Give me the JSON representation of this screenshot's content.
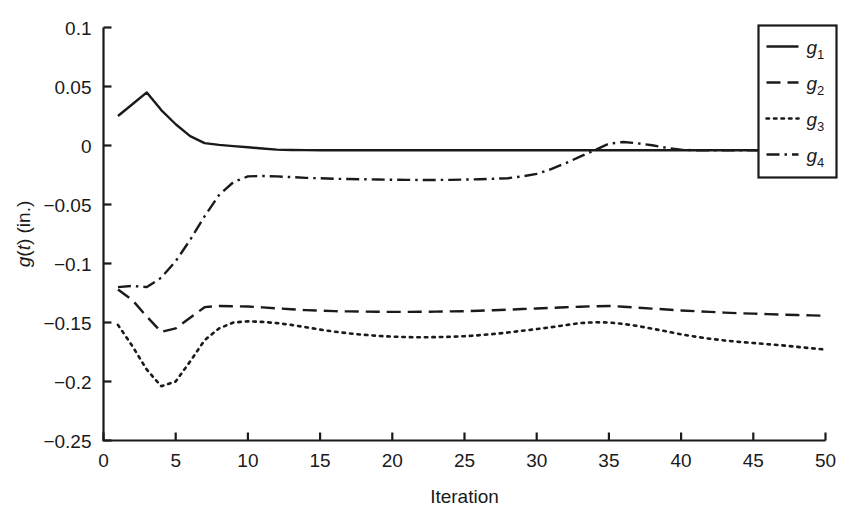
{
  "chart_data": {
    "type": "line",
    "title": "",
    "xlabel": "Iteration",
    "ylabel": "g(t) (in.)",
    "ylabel_parts": {
      "g": "g",
      "open": "(",
      "t": "t",
      "close": ")",
      "unit": " (in.)"
    },
    "xlim": [
      0,
      50
    ],
    "ylim": [
      -0.25,
      0.1
    ],
    "xticks": [
      0,
      5,
      10,
      15,
      20,
      25,
      30,
      35,
      40,
      45,
      50
    ],
    "xticklabels": [
      "0",
      "5",
      "10",
      "15",
      "20",
      "25",
      "30",
      "35",
      "40",
      "45",
      "50"
    ],
    "yticks": [
      0.1,
      0.05,
      0,
      -0.05,
      -0.1,
      -0.15,
      -0.2,
      -0.25
    ],
    "yticklabels": [
      "0.1",
      "0.05",
      "0",
      "−0.05",
      "−0.1",
      "−0.15",
      "−0.2",
      "−0.25"
    ],
    "grid": false,
    "legend_position": "top-right",
    "line_color": "#1a1a1a",
    "x": [
      1,
      2,
      3,
      4,
      5,
      6,
      7,
      8,
      9,
      10,
      11,
      12,
      13,
      14,
      15,
      16,
      17,
      18,
      19,
      20,
      21,
      22,
      23,
      24,
      25,
      26,
      27,
      28,
      29,
      30,
      31,
      32,
      33,
      34,
      35,
      36,
      37,
      38,
      39,
      40,
      41,
      42,
      43,
      44,
      45,
      46,
      47,
      48,
      49,
      50
    ],
    "series": [
      {
        "name": "g1",
        "label": "g",
        "sublabel": "1",
        "dash": "solid",
        "values": [
          0.025,
          0.035,
          0.045,
          0.03,
          0.018,
          0.008,
          0.002,
          0.0005,
          -0.0005,
          -0.0015,
          -0.0025,
          -0.0035,
          -0.0038,
          -0.0039,
          -0.004,
          -0.004,
          -0.004,
          -0.004,
          -0.004,
          -0.004,
          -0.004,
          -0.004,
          -0.004,
          -0.004,
          -0.004,
          -0.004,
          -0.004,
          -0.004,
          -0.004,
          -0.004,
          -0.004,
          -0.004,
          -0.004,
          -0.004,
          -0.004,
          -0.004,
          -0.004,
          -0.004,
          -0.004,
          -0.004,
          -0.004,
          -0.004,
          -0.004,
          -0.004,
          -0.004,
          -0.004,
          -0.004,
          -0.004,
          -0.004,
          -0.004
        ]
      },
      {
        "name": "g2",
        "label": "g",
        "sublabel": "2",
        "dash": "dashed",
        "values": [
          -0.122,
          -0.131,
          -0.145,
          -0.158,
          -0.155,
          -0.146,
          -0.137,
          -0.136,
          -0.1362,
          -0.1365,
          -0.1372,
          -0.138,
          -0.1388,
          -0.1395,
          -0.14,
          -0.1404,
          -0.1406,
          -0.1408,
          -0.1409,
          -0.141,
          -0.141,
          -0.1409,
          -0.1408,
          -0.1406,
          -0.1404,
          -0.14,
          -0.1396,
          -0.1391,
          -0.1386,
          -0.1381,
          -0.1376,
          -0.1371,
          -0.1366,
          -0.1362,
          -0.136,
          -0.1366,
          -0.1374,
          -0.1382,
          -0.139,
          -0.1398,
          -0.1404,
          -0.141,
          -0.1416,
          -0.1421,
          -0.1425,
          -0.1429,
          -0.1433,
          -0.1437,
          -0.144,
          -0.1443
        ]
      },
      {
        "name": "g3",
        "label": "g",
        "sublabel": "3",
        "dash": "dotted",
        "values": [
          -0.152,
          -0.17,
          -0.19,
          -0.204,
          -0.2,
          -0.183,
          -0.165,
          -0.155,
          -0.15,
          -0.149,
          -0.1495,
          -0.1505,
          -0.152,
          -0.154,
          -0.156,
          -0.1578,
          -0.1592,
          -0.1604,
          -0.1613,
          -0.162,
          -0.1624,
          -0.1625,
          -0.1624,
          -0.1621,
          -0.1616,
          -0.1608,
          -0.1598,
          -0.1585,
          -0.157,
          -0.1556,
          -0.154,
          -0.1522,
          -0.1505,
          -0.1498,
          -0.15,
          -0.1512,
          -0.153,
          -0.1552,
          -0.1576,
          -0.16,
          -0.162,
          -0.1638,
          -0.1652,
          -0.1664,
          -0.1674,
          -0.1684,
          -0.1694,
          -0.1706,
          -0.1718,
          -0.173
        ]
      },
      {
        "name": "g4",
        "label": "g",
        "sublabel": "4",
        "dash": "dashdot",
        "values": [
          -0.12,
          -0.119,
          -0.12,
          -0.112,
          -0.098,
          -0.08,
          -0.06,
          -0.042,
          -0.031,
          -0.0262,
          -0.0258,
          -0.0262,
          -0.0268,
          -0.0274,
          -0.0278,
          -0.0282,
          -0.0284,
          -0.0286,
          -0.0288,
          -0.029,
          -0.0291,
          -0.0292,
          -0.0292,
          -0.0291,
          -0.0289,
          -0.0286,
          -0.0282,
          -0.0277,
          -0.0262,
          -0.024,
          -0.02,
          -0.015,
          -0.0095,
          -0.004,
          0.0015,
          0.003,
          0.0018,
          0.0002,
          -0.002,
          -0.0036,
          -0.004,
          -0.004,
          -0.004,
          -0.004,
          -0.004,
          -0.004,
          -0.004,
          -0.004,
          -0.004,
          -0.004
        ]
      }
    ]
  }
}
